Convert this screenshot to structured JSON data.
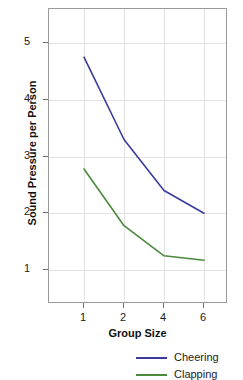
{
  "chart_data": {
    "type": "line",
    "title": "",
    "xlabel": "Group Size",
    "ylabel": "Sound Pressure per Person",
    "categories": [
      "1",
      "2",
      "4",
      "6"
    ],
    "x_tick_labels": [
      "1",
      "2",
      "4",
      "6"
    ],
    "y_tick_labels": [
      "1",
      "2",
      "3",
      "4",
      "5"
    ],
    "y_ticks": [
      1,
      2,
      3,
      4,
      5
    ],
    "ylim": [
      0.4,
      5.6
    ],
    "grid": true,
    "legend_position": "bottom-right",
    "series": [
      {
        "name": "Cheering",
        "color": "#3b3b9e",
        "values": [
          4.75,
          3.3,
          2.4,
          2.0
        ]
      },
      {
        "name": "Clapping",
        "color": "#4a8a3a",
        "values": [
          2.78,
          1.78,
          1.25,
          1.17
        ]
      }
    ]
  },
  "axes": {
    "y_tick_labels": [
      "5",
      "4",
      "3",
      "2",
      "1"
    ],
    "x_tick_labels": [
      "1",
      "2",
      "4",
      "6"
    ],
    "ylabel": "Sound Pressure per Person",
    "xlabel": "Group Size"
  },
  "legend": {
    "entries": [
      {
        "label": "Cheering",
        "color": "#3b3b9e"
      },
      {
        "label": "Clapping",
        "color": "#4a8a3a"
      }
    ]
  },
  "colors": {
    "cheering": "#3b3b9e",
    "clapping": "#4a8a3a",
    "grid": "#e2e2e2",
    "frame": "#9a9a9a",
    "text": "#1a1a1a"
  }
}
